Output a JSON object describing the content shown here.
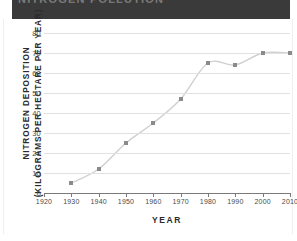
{
  "banner": {
    "text": "NITROGEN POLLUTION",
    "note": "cropped-illegible",
    "color": "#3a3a3a"
  },
  "chart_data": {
    "type": "scatter",
    "title": "",
    "xlabel": "YEAR",
    "ylabel_line1": "NITROGEN DEPOSITION",
    "ylabel_line2": "(KILOGRAMS PER HECTARE PER YEAR)",
    "x": [
      1930,
      1940,
      1950,
      1960,
      1970,
      1980,
      1990,
      2000,
      2010
    ],
    "values": [
      5,
      12,
      25,
      35,
      47,
      65,
      64,
      70,
      70
    ],
    "xlim": [
      1920,
      2010
    ],
    "ylim": [
      0,
      80
    ],
    "xticks": [
      1920,
      1930,
      1940,
      1950,
      1960,
      1970,
      1980,
      1990,
      2000,
      2010
    ],
    "yticks": [
      0,
      10,
      20,
      30,
      40,
      50,
      60,
      70,
      80
    ],
    "grid": "horizontal",
    "legend": "none",
    "marker": "square",
    "marker_color": "#8a8a8a",
    "trendline": "smooth-s-curve",
    "trendline_color": "#d0d0d0"
  }
}
